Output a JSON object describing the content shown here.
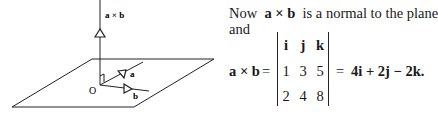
{
  "figure": {
    "labels": {
      "normal": "a × b",
      "vec_a": "a",
      "vec_b": "b",
      "origin": "O"
    }
  },
  "text": {
    "line1_prefix": "Now",
    "line1_vector": "a × b",
    "line1_suffix": "is a normal to the plane",
    "line2": "and",
    "lhs": "a × b",
    "eq1": "=",
    "eq2": "=",
    "result": "4i + 2j − 2k."
  },
  "determinant": {
    "rows": [
      [
        "i",
        "j",
        "k"
      ],
      [
        "1",
        "3",
        "5"
      ],
      [
        "2",
        "4",
        "8"
      ]
    ]
  }
}
